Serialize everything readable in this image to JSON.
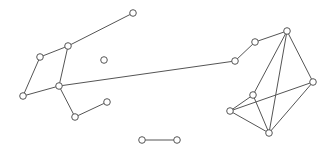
{
  "diagram": {
    "type": "network-graph",
    "width": 334,
    "height": 155,
    "colors": {
      "edge": "#555555",
      "node_fill": "#ffffff",
      "node_stroke": "#555555",
      "background": "#ffffff"
    },
    "node_radius": 3.3,
    "nodes": [
      {
        "id": "A",
        "x": 133,
        "y": 13
      },
      {
        "id": "B",
        "x": 68,
        "y": 46
      },
      {
        "id": "C",
        "x": 40,
        "y": 57
      },
      {
        "id": "D",
        "x": 104,
        "y": 60
      },
      {
        "id": "E",
        "x": 23,
        "y": 96
      },
      {
        "id": "F",
        "x": 59,
        "y": 86
      },
      {
        "id": "G",
        "x": 75,
        "y": 117
      },
      {
        "id": "H",
        "x": 107,
        "y": 102
      },
      {
        "id": "I",
        "x": 235,
        "y": 61
      },
      {
        "id": "J",
        "x": 255,
        "y": 42
      },
      {
        "id": "K",
        "x": 287,
        "y": 31
      },
      {
        "id": "L",
        "x": 313,
        "y": 82
      },
      {
        "id": "M",
        "x": 253,
        "y": 95
      },
      {
        "id": "N",
        "x": 230,
        "y": 111
      },
      {
        "id": "O",
        "x": 269,
        "y": 133
      },
      {
        "id": "P",
        "x": 142,
        "y": 140
      },
      {
        "id": "Q",
        "x": 177,
        "y": 140
      }
    ],
    "edges": [
      [
        "A",
        "B"
      ],
      [
        "B",
        "C"
      ],
      [
        "C",
        "E"
      ],
      [
        "B",
        "F"
      ],
      [
        "E",
        "F"
      ],
      [
        "F",
        "G"
      ],
      [
        "G",
        "H"
      ],
      [
        "F",
        "I"
      ],
      [
        "I",
        "J"
      ],
      [
        "J",
        "K"
      ],
      [
        "K",
        "L"
      ],
      [
        "K",
        "M"
      ],
      [
        "K",
        "O"
      ],
      [
        "L",
        "O"
      ],
      [
        "L",
        "N"
      ],
      [
        "M",
        "N"
      ],
      [
        "M",
        "O"
      ],
      [
        "N",
        "O"
      ],
      [
        "P",
        "Q"
      ]
    ]
  }
}
